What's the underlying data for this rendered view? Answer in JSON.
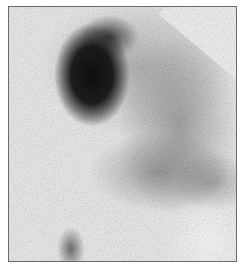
{
  "image": {
    "type": "grayscale scintigraphy image",
    "description": "Nuclear medicine scan with a large dark focal region of uptake in the upper-left and diffuse mottled uptake across the right and lower portions, framed by a thin gray border",
    "colors": {
      "background": "#efefef",
      "hot_spot": "#141414",
      "diffuse_uptake": "#8a8a8a",
      "frame": "#6a6a6a"
    }
  }
}
